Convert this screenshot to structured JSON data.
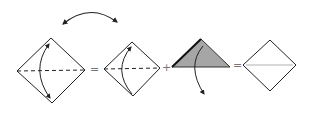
{
  "diagram": {
    "type": "origami-fold-sequence",
    "colors": {
      "line": "#222222",
      "fill_folded": "#a6a6a6",
      "crease_light": "#b0b0b0",
      "operator": "#777777"
    },
    "operators": {
      "equals_1": "=",
      "plus": "+",
      "equals_2": "="
    },
    "steps": [
      {
        "id": "square-1",
        "shape": "diamond",
        "crease": "dashed-horizontal",
        "arrow": "fold-top-to-bottom-double"
      },
      {
        "id": "square-2",
        "shape": "diamond",
        "crease": "dashed-horizontal",
        "arrow": "fold-bottom-to-top"
      },
      {
        "id": "triangle",
        "shape": "triangle-shaded",
        "arrow": "unfold-down"
      },
      {
        "id": "square-result",
        "shape": "diamond",
        "crease": "thin-horizontal"
      }
    ],
    "top_arrow": "double-headed-arc-between-step-1-and-2"
  }
}
